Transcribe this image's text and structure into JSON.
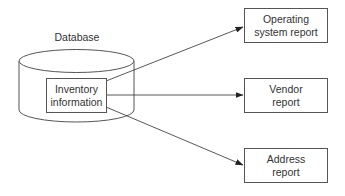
{
  "diagram": {
    "database": {
      "label": "Database",
      "inner": {
        "line1": "Inventory",
        "line2": "information"
      }
    },
    "reports": [
      {
        "line1": "Operating",
        "line2": "system report"
      },
      {
        "line1": "Vendor",
        "line2": "report"
      },
      {
        "line1": "Address",
        "line2": "report"
      }
    ],
    "edges": [
      {
        "from": "Inventory information",
        "to": "Operating system report"
      },
      {
        "from": "Inventory information",
        "to": "Vendor report"
      },
      {
        "from": "Inventory information",
        "to": "Address report"
      }
    ],
    "colors": {
      "stroke": "#555555",
      "background": "#ffffff",
      "text": "#333333"
    }
  }
}
